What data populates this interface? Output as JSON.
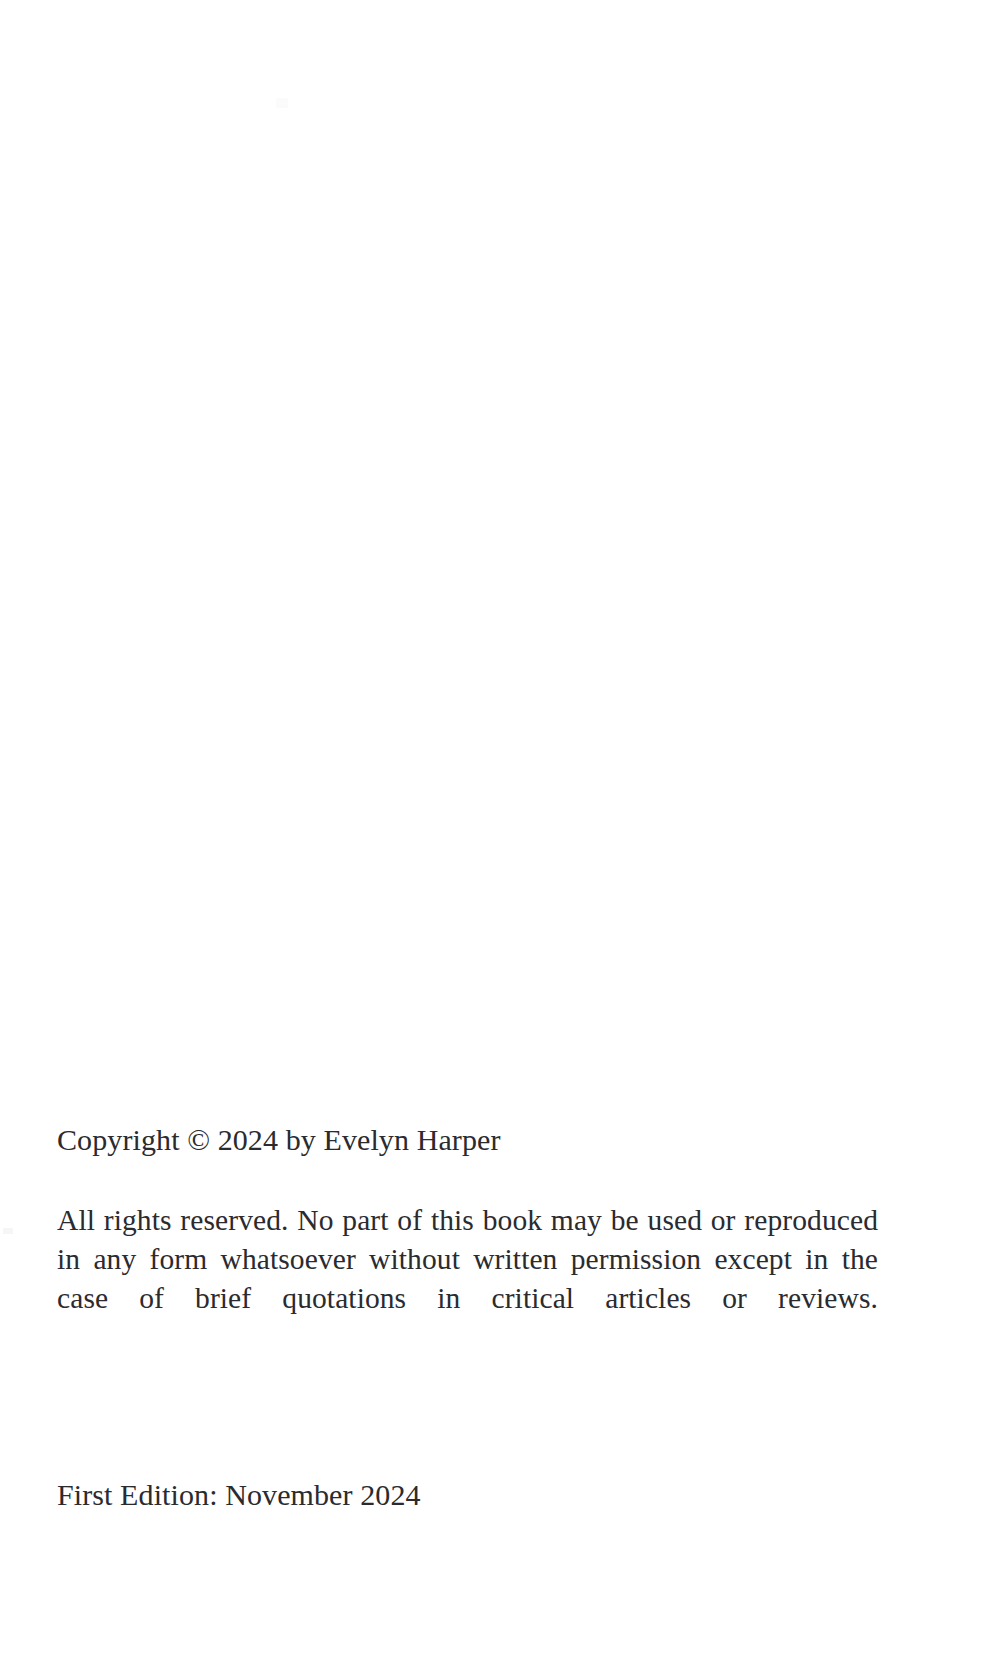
{
  "page": {
    "kind": "book-copyright-page",
    "background_color": "#ffffff",
    "text_color": "#2b2b2f",
    "width": 997,
    "height": 1679
  },
  "copyright": {
    "line": "Copyright © 2024 by Evelyn Harper",
    "symbol": "©",
    "year": "2024",
    "holder": "Evelyn Harper"
  },
  "rights": {
    "paragraph": "All rights reserved. No part of this book may be used or reproduced in any form whatsoever without written permission except in the case of brief quotations in critical articles or reviews.",
    "lines": [
      "All rights reserved. No part of this book may be used or reproduced in",
      "any form whatsoever without written permission except in the case of",
      "brief quotations in critical articles or reviews."
    ]
  },
  "edition": {
    "line": "First Edition: November 2024",
    "label": "First Edition",
    "month": "November",
    "year": "2024"
  }
}
